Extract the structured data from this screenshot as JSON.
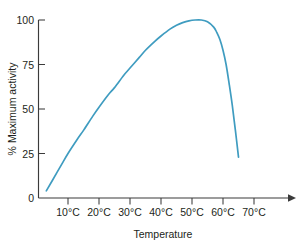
{
  "chart_data": {
    "type": "line",
    "title": "",
    "xlabel": "Temperature",
    "ylabel": "% Maximum activity",
    "xlim": [
      0,
      80
    ],
    "ylim": [
      0,
      100
    ],
    "grid": false,
    "legend": false,
    "x_tick_labels": [
      "10°C",
      "20°C",
      "30°C",
      "40°C",
      "50°C",
      "60°C",
      "70°C"
    ],
    "x_tick_values": [
      10,
      20,
      30,
      40,
      50,
      60,
      70
    ],
    "y_tick_labels": [
      "0",
      "25",
      "50",
      "75",
      "100"
    ],
    "y_tick_values": [
      0,
      25,
      50,
      75,
      100
    ],
    "series": [
      {
        "name": "Enzyme activity",
        "color": "#3f9cc0",
        "x": [
          3,
          5,
          8,
          10,
          13,
          15,
          18,
          20,
          23,
          25,
          28,
          30,
          33,
          35,
          38,
          40,
          43,
          45,
          47,
          49,
          51,
          53,
          55,
          57,
          58,
          59,
          60,
          61,
          62,
          63,
          64,
          65
        ],
        "y": [
          4,
          10,
          19,
          25,
          33,
          38,
          46,
          51,
          58,
          62,
          69,
          73,
          79,
          83,
          88,
          91,
          95,
          97,
          98.5,
          99.5,
          100,
          100,
          99,
          96,
          93,
          89,
          83,
          75,
          64,
          52,
          38,
          23
        ]
      }
    ]
  },
  "axis": {
    "x_arrow": "arrow-right"
  }
}
